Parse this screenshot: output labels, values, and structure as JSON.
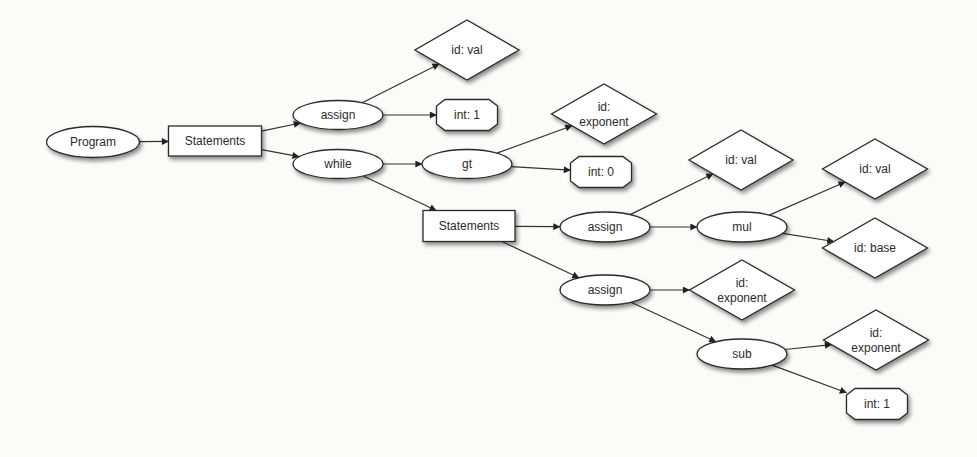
{
  "diagram": {
    "type": "abstract-syntax-tree",
    "nodes": [
      {
        "id": "program",
        "label": [
          "Program"
        ],
        "shape": "ellipse",
        "cx": 93,
        "cy": 142,
        "w": 93,
        "h": 31
      },
      {
        "id": "statements1",
        "label": [
          "Statements"
        ],
        "shape": "box",
        "cx": 215,
        "cy": 141,
        "w": 93,
        "h": 30
      },
      {
        "id": "assign1",
        "label": [
          "assign"
        ],
        "shape": "ellipse",
        "cx": 338,
        "cy": 115,
        "w": 90,
        "h": 29
      },
      {
        "id": "while",
        "label": [
          "while"
        ],
        "shape": "ellipse",
        "cx": 338,
        "cy": 164,
        "w": 90,
        "h": 29
      },
      {
        "id": "idval1",
        "label": [
          "id: val"
        ],
        "shape": "diamond",
        "cx": 467,
        "cy": 50,
        "w": 104,
        "h": 60
      },
      {
        "id": "int1a",
        "label": [
          "int: 1"
        ],
        "shape": "octagon",
        "cx": 467,
        "cy": 115,
        "w": 61,
        "h": 31
      },
      {
        "id": "gt",
        "label": [
          "gt"
        ],
        "shape": "ellipse",
        "cx": 467,
        "cy": 164,
        "w": 90,
        "h": 29
      },
      {
        "id": "idexp1",
        "label": [
          "id:",
          "exponent"
        ],
        "shape": "diamond",
        "cx": 604,
        "cy": 114,
        "w": 105,
        "h": 60
      },
      {
        "id": "int0",
        "label": [
          "int: 0"
        ],
        "shape": "octagon",
        "cx": 601,
        "cy": 172,
        "w": 61,
        "h": 31
      },
      {
        "id": "statements2",
        "label": [
          "Statements"
        ],
        "shape": "box",
        "cx": 469,
        "cy": 226,
        "w": 92,
        "h": 31
      },
      {
        "id": "assign2",
        "label": [
          "assign"
        ],
        "shape": "ellipse",
        "cx": 605,
        "cy": 227,
        "w": 90,
        "h": 30
      },
      {
        "id": "assign3",
        "label": [
          "assign"
        ],
        "shape": "ellipse",
        "cx": 605,
        "cy": 290,
        "w": 90,
        "h": 30
      },
      {
        "id": "idval2",
        "label": [
          "id: val"
        ],
        "shape": "diamond",
        "cx": 741,
        "cy": 160,
        "w": 104,
        "h": 60
      },
      {
        "id": "mul",
        "label": [
          "mul"
        ],
        "shape": "ellipse",
        "cx": 742,
        "cy": 227,
        "w": 90,
        "h": 30
      },
      {
        "id": "idexp2",
        "label": [
          "id:",
          "exponent"
        ],
        "shape": "diamond",
        "cx": 742,
        "cy": 290,
        "w": 105,
        "h": 60
      },
      {
        "id": "sub",
        "label": [
          "sub"
        ],
        "shape": "ellipse",
        "cx": 742,
        "cy": 354,
        "w": 90,
        "h": 30
      },
      {
        "id": "idval3",
        "label": [
          "id: val"
        ],
        "shape": "diamond",
        "cx": 875,
        "cy": 169,
        "w": 105,
        "h": 60
      },
      {
        "id": "idbase",
        "label": [
          "id: base"
        ],
        "shape": "diamond",
        "cx": 875,
        "cy": 248,
        "w": 105,
        "h": 60
      },
      {
        "id": "idexp3",
        "label": [
          "id:",
          "exponent"
        ],
        "shape": "diamond",
        "cx": 876,
        "cy": 340,
        "w": 105,
        "h": 60
      },
      {
        "id": "int1b",
        "label": [
          "int: 1"
        ],
        "shape": "octagon",
        "cx": 877,
        "cy": 404,
        "w": 61,
        "h": 31
      }
    ],
    "edges": [
      {
        "from": "program",
        "to": "statements1"
      },
      {
        "from": "statements1",
        "to": "assign1"
      },
      {
        "from": "statements1",
        "to": "while"
      },
      {
        "from": "assign1",
        "to": "idval1"
      },
      {
        "from": "assign1",
        "to": "int1a"
      },
      {
        "from": "while",
        "to": "gt"
      },
      {
        "from": "while",
        "to": "statements2"
      },
      {
        "from": "gt",
        "to": "idexp1"
      },
      {
        "from": "gt",
        "to": "int0"
      },
      {
        "from": "statements2",
        "to": "assign2"
      },
      {
        "from": "statements2",
        "to": "assign3"
      },
      {
        "from": "assign2",
        "to": "idval2"
      },
      {
        "from": "assign2",
        "to": "mul"
      },
      {
        "from": "mul",
        "to": "idval3"
      },
      {
        "from": "mul",
        "to": "idbase"
      },
      {
        "from": "assign3",
        "to": "idexp2"
      },
      {
        "from": "assign3",
        "to": "sub"
      },
      {
        "from": "sub",
        "to": "idexp3"
      },
      {
        "from": "sub",
        "to": "int1b"
      }
    ],
    "colors": {
      "background": "#fbfbfa",
      "stroke": "#2a2a2a",
      "fill": "#ffffff",
      "text": "#2b2b2b"
    }
  }
}
